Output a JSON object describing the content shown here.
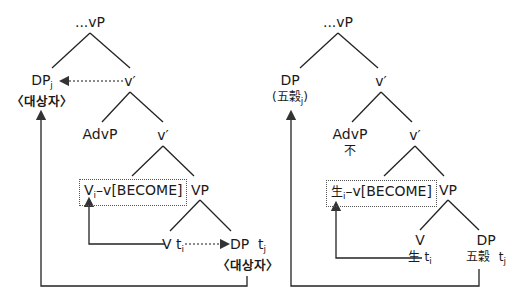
{
  "left_tree": {
    "root": "...vP",
    "spec": {
      "label": "DP",
      "index": "j",
      "gloss": "〈대상자〉"
    },
    "vbar1": "v′",
    "adv": "AdvP",
    "vbar2": "v′",
    "head_box": {
      "label": "V",
      "index": "i",
      "rest": "–v[BECOME]"
    },
    "vp": "VP",
    "v_trace": {
      "label": "V",
      "trace": "t",
      "index": "i"
    },
    "dp_trace": {
      "label": "DP",
      "trace": "t",
      "index": "j",
      "gloss": "〈대상자〉"
    }
  },
  "right_tree": {
    "root": "...vP",
    "spec": {
      "label": "DP",
      "gloss_open": "(",
      "gloss": "五穀",
      "index": "j",
      "gloss_close": ")"
    },
    "vbar1": "v′",
    "adv": "AdvP",
    "adv_word": "不",
    "vbar2": "v′",
    "head_box": {
      "label": "生",
      "index": "i",
      "rest": "–v[BECOME]"
    },
    "vp": "VP",
    "v_node": {
      "label": "V",
      "word": "生",
      "trace": "t",
      "index": "i"
    },
    "dp_node": {
      "label": "DP",
      "word": "五穀",
      "trace": "t",
      "index": "j"
    }
  }
}
